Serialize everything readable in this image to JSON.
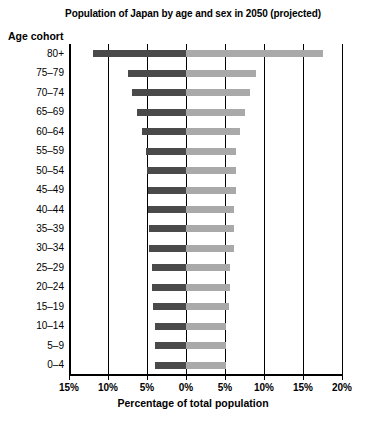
{
  "chart_data": {
    "type": "bar",
    "subtype": "population-pyramid",
    "title": "Population of Japan by age and sex in 2050 (projected)",
    "xlabel": "Percentage of total population",
    "ylabel": "Age cohort",
    "grid": true,
    "legend": "none",
    "xlim": [
      -15,
      20
    ],
    "xticks": [
      -15,
      -10,
      -5,
      0,
      5,
      10,
      15,
      20
    ],
    "xticklabels": [
      "15%",
      "10%",
      "5%",
      "0%",
      "5%",
      "10%",
      "15%",
      "20%"
    ],
    "categories": [
      "80+",
      "75–79",
      "70–74",
      "65–69",
      "60–64",
      "55–59",
      "50–54",
      "45–49",
      "40–44",
      "35–39",
      "30–34",
      "25–29",
      "20–24",
      "15–19",
      "10–14",
      "5–9",
      "0–4"
    ],
    "series": [
      {
        "name": "Male (left)",
        "color": "#4a4a4a",
        "side": "left",
        "values": [
          11.9,
          7.4,
          6.9,
          6.3,
          5.6,
          5.1,
          5.0,
          4.9,
          4.9,
          4.8,
          4.7,
          4.3,
          4.3,
          4.2,
          4.0,
          4.0,
          4.0
        ]
      },
      {
        "name": "Female (right)",
        "color": "#a9a9a9",
        "side": "right",
        "values": [
          17.6,
          9.0,
          8.2,
          7.6,
          6.9,
          6.4,
          6.4,
          6.4,
          6.2,
          6.2,
          6.2,
          5.6,
          5.6,
          5.5,
          5.1,
          5.1,
          5.1
        ]
      }
    ]
  },
  "colors": {
    "male": "#4a4a4a",
    "female": "#a9a9a9",
    "axis": "#000000",
    "background": "#ffffff"
  }
}
